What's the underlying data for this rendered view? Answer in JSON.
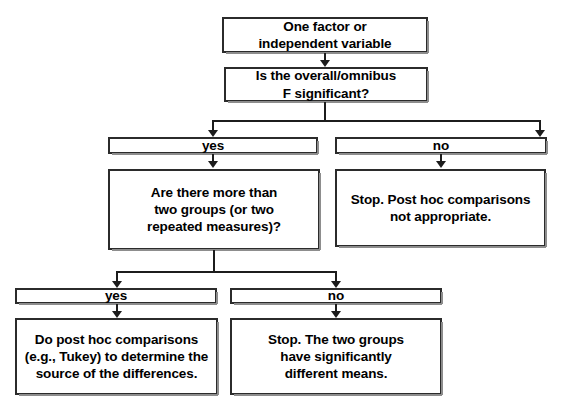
{
  "diagram": {
    "background_color": "#ffffff",
    "line_color": "#1c1c1c",
    "box_border_color": "#2b2b2b",
    "text_color": "#000000"
  },
  "nodes": {
    "start": {
      "text": "One factor or\nindependent variable"
    },
    "omnibus_question": {
      "text": "Is the overall/omnibus\nF significant?"
    },
    "yes_1": {
      "text": "yes"
    },
    "no_1": {
      "text": "no"
    },
    "groups_question": {
      "text": "Are there more than\ntwo groups (or two\nrepeated measures)?"
    },
    "stop_not_appropriate": {
      "text": "Stop. Post hoc comparisons\nnot appropriate."
    },
    "yes_2": {
      "text": "yes"
    },
    "no_2": {
      "text": "no"
    },
    "do_post_hoc": {
      "text": "Do post hoc comparisons\n(e.g., Tukey) to determine the\nsource of the differences."
    },
    "stop_two_groups": {
      "text": "Stop. The two groups\nhave significantly\ndifferent means."
    }
  }
}
